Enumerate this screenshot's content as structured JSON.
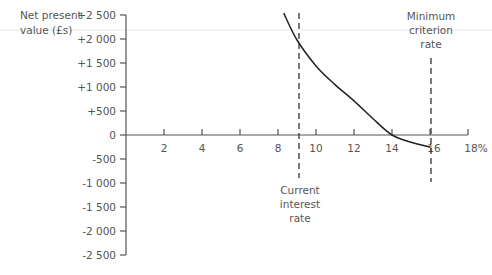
{
  "chart_data": {
    "type": "line",
    "title": "",
    "ylabel": "Net present value (£s)",
    "ylabel_lines": [
      "Net present",
      "value (£s)"
    ],
    "xlabel": "",
    "x_unit": "%",
    "xlim": [
      0,
      18
    ],
    "ylim": [
      -2500,
      2500
    ],
    "grid": false,
    "y_ticks": [
      2500,
      2000,
      1500,
      1000,
      500,
      0,
      -500,
      -1000,
      -1500,
      -2000,
      -2500
    ],
    "y_tick_labels": [
      "+2 500",
      "+2 000",
      "+1 500",
      "+1 000",
      "+500",
      "0",
      "-500",
      "-1 000",
      "-1 500",
      "-2 000",
      "-2 500"
    ],
    "x_ticks": [
      2,
      4,
      6,
      8,
      10,
      12,
      14,
      16,
      18
    ],
    "x_tick_labels": [
      "2",
      "4",
      "6",
      "8",
      "10",
      "12",
      "14",
      "16",
      "18%"
    ],
    "series": [
      {
        "name": "NPV curve",
        "x": [
          8.3,
          9.0,
          10.0,
          11.0,
          12.0,
          13.0,
          14.0,
          15.0,
          16.0
        ],
        "y": [
          2540,
          1980,
          1440,
          1050,
          710,
          340,
          0,
          -150,
          -250
        ]
      }
    ],
    "annotations": [
      {
        "type": "vline",
        "x": 9.2,
        "style": "dashed",
        "label_lines": [
          "Current",
          "interest",
          "rate"
        ],
        "label_position": "below"
      },
      {
        "type": "vline",
        "x": 16,
        "style": "dashed",
        "label_lines": [
          "Minimum",
          "criterion",
          "rate"
        ],
        "label_position": "above"
      }
    ]
  }
}
